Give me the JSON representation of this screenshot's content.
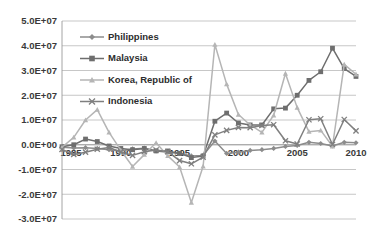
{
  "chart_data": {
    "type": "line",
    "title": "",
    "subtitle": "",
    "xlabel": "",
    "ylabel": "",
    "grid": true,
    "legend_position": "inside-top-left",
    "x": [
      1985,
      1986,
      1987,
      1988,
      1989,
      1990,
      1991,
      1992,
      1993,
      1994,
      1995,
      1996,
      1997,
      1998,
      1999,
      2000,
      2001,
      2002,
      2003,
      2004,
      2005,
      2006,
      2007,
      2008,
      2009,
      2010
    ],
    "xlim": [
      1985,
      2010
    ],
    "ylim": [
      -30000000,
      50000000
    ],
    "ytick_labels": [
      "5.0E+07",
      "4.0E+07",
      "3.0E+07",
      "2.0E+07",
      "1.0E+07",
      "0.0E+00",
      "-1.0E+07",
      "-2.0E+07",
      "-3.0E+07"
    ],
    "ytick_values": [
      50000000,
      40000000,
      30000000,
      20000000,
      10000000,
      0,
      -10000000,
      -20000000,
      -30000000
    ],
    "xtick_labels": [
      "1985",
      "1990",
      "1995",
      "2000",
      "2005",
      "2010"
    ],
    "xtick_values": [
      1985,
      1990,
      1995,
      2000,
      2005,
      2010
    ],
    "series": [
      {
        "name": "Philippines",
        "marker": "diamond",
        "color": "#8c8c8c",
        "values": [
          -1000000,
          -1300000,
          -1200000,
          -1500000,
          -2000000,
          -2500000,
          -1700000,
          -1400000,
          -2500000,
          -3000000,
          -3500000,
          -4500000,
          -4300000,
          1500000,
          -3500000,
          -3000000,
          -2300000,
          -2000000,
          -1500000,
          -700000,
          -300000,
          1000000,
          500000,
          -500000,
          1000000,
          800000
        ]
      },
      {
        "name": "Malaysia",
        "marker": "square",
        "color": "#6e6e6e",
        "values": [
          -800000,
          0,
          2300000,
          1300000,
          -500000,
          -1500000,
          -2000000,
          -1500000,
          -2500000,
          -2500000,
          -3500000,
          -5200000,
          -4500000,
          9500000,
          12800000,
          8800000,
          8000000,
          8000000,
          14500000,
          14800000,
          20000000,
          26000000,
          29500000,
          39000000,
          30800000,
          27600000
        ]
      },
      {
        "name": "Korea, Republic of",
        "marker": "triangle",
        "color": "#b5b5b5",
        "values": [
          -1000000,
          3000000,
          10000000,
          14200000,
          5000000,
          -2200000,
          -8800000,
          -4000000,
          800000,
          -4500000,
          -9000000,
          -23300000,
          -8700000,
          40500000,
          24500000,
          12200000,
          8000000,
          5000000,
          11900000,
          28800000,
          15000000,
          5300000,
          5800000,
          -600000,
          32500000,
          28500000
        ]
      },
      {
        "name": "Indonesia",
        "marker": "x",
        "color": "#7f7f7f",
        "values": [
          -1900000,
          -3900000,
          -3000000,
          -1800000,
          -1100000,
          -2900000,
          -4300000,
          -2800000,
          -2100000,
          -2800000,
          -6400000,
          -7700000,
          -5000000,
          4000000,
          5800000,
          7000000,
          6900000,
          7800000,
          8100000,
          1600000,
          300000,
          10100000,
          10500000,
          100000,
          10200000,
          5600000
        ]
      }
    ]
  },
  "legend": {
    "items": [
      {
        "label": "Philippines"
      },
      {
        "label": "Malaysia"
      },
      {
        "label": "Korea, Republic of"
      },
      {
        "label": "Indonesia"
      }
    ]
  },
  "colors": {
    "background": "#ffffff",
    "gridline": "#b9b9b9",
    "axis": "#9a9a9a",
    "text": "#3a3a3a"
  }
}
